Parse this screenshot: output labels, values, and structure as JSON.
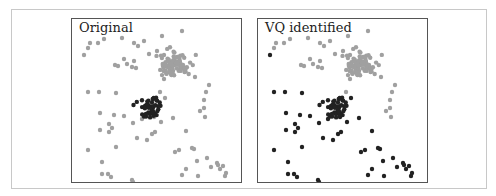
{
  "chart_data": [
    {
      "type": "scatter",
      "title": "Original",
      "xlabel": "",
      "ylabel": "",
      "grid": false,
      "point_radius": 2.2,
      "colors": {
        "dense_cluster": "#a0a0a0",
        "background": "#a0a0a0",
        "vq_cluster": "#222222"
      },
      "description": "Dense gray cluster upper-right, small black cluster center, scattered gray background points"
    },
    {
      "type": "scatter",
      "title": "VQ identified",
      "xlabel": "",
      "ylabel": "",
      "grid": false,
      "point_radius": 2.2,
      "colors": {
        "group_a": "#a0a0a0",
        "group_b": "#222222"
      },
      "description": "Same points; those nearer the center cluster (lower-left region) colored black by vector quantization"
    }
  ],
  "panels": [
    {
      "title": "Original"
    },
    {
      "title": "VQ identified"
    }
  ],
  "clusters": {
    "gray": {
      "cx": 102,
      "cy": 45,
      "sx": 7,
      "sy": 6,
      "n": 90,
      "seed": 7
    },
    "black": {
      "cx": 80,
      "cy": 88,
      "sx": 6,
      "sy": 5.5,
      "n": 45,
      "seed": 21
    }
  },
  "scatter": [
    [
      18,
      24
    ],
    [
      26,
      24
    ],
    [
      32,
      20
    ],
    [
      12,
      36
    ],
    [
      16,
      29
    ],
    [
      43,
      46
    ],
    [
      46,
      47
    ],
    [
      52,
      40
    ],
    [
      55,
      45
    ],
    [
      60,
      48
    ],
    [
      62,
      42
    ],
    [
      64,
      49
    ],
    [
      50,
      19
    ],
    [
      62,
      24
    ],
    [
      66,
      27
    ],
    [
      85,
      32
    ],
    [
      92,
      36
    ],
    [
      99,
      55
    ],
    [
      92,
      60
    ],
    [
      88,
      73
    ],
    [
      77,
      35
    ],
    [
      72,
      22
    ],
    [
      90,
      17
    ],
    [
      110,
      12
    ],
    [
      16,
      73
    ],
    [
      27,
      73
    ],
    [
      44,
      74
    ],
    [
      93,
      79
    ],
    [
      123,
      58
    ],
    [
      132,
      81
    ],
    [
      134,
      73
    ],
    [
      132,
      89
    ],
    [
      137,
      66
    ],
    [
      133,
      98
    ],
    [
      128,
      92
    ],
    [
      28,
      94
    ],
    [
      42,
      96
    ],
    [
      52,
      97
    ],
    [
      37,
      105
    ],
    [
      40,
      109
    ],
    [
      28,
      111
    ],
    [
      37,
      113
    ],
    [
      61,
      104
    ],
    [
      70,
      100
    ],
    [
      82,
      98
    ],
    [
      89,
      103
    ],
    [
      101,
      99
    ],
    [
      80,
      115
    ],
    [
      65,
      119
    ],
    [
      75,
      121
    ],
    [
      83,
      113
    ],
    [
      16,
      131
    ],
    [
      44,
      128
    ],
    [
      30,
      143
    ],
    [
      30,
      155
    ],
    [
      36,
      155
    ],
    [
      39,
      158
    ],
    [
      60,
      161
    ],
    [
      61,
      163
    ],
    [
      114,
      112
    ],
    [
      122,
      130
    ],
    [
      125,
      142
    ],
    [
      126,
      157
    ],
    [
      139,
      148
    ],
    [
      145,
      144
    ],
    [
      148,
      150
    ],
    [
      151,
      147
    ],
    [
      153,
      157
    ],
    [
      103,
      133
    ],
    [
      107,
      131
    ],
    [
      114,
      150
    ],
    [
      120,
      129
    ],
    [
      135,
      139
    ],
    [
      146,
      146
    ],
    [
      154,
      154
    ],
    [
      110,
      156
    ]
  ],
  "split_line": {
    "nx": -0.55,
    "ny": 1.0,
    "c": 26
  }
}
